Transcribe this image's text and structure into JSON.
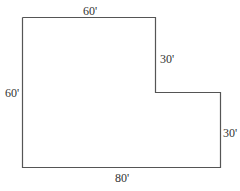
{
  "diagram": {
    "type": "floor-plan-L-shape",
    "stroke_color": "#555555",
    "labels": {
      "top": "60'",
      "left": "60'",
      "inner_vertical": "30'",
      "right": "30'",
      "bottom": "80'"
    }
  }
}
